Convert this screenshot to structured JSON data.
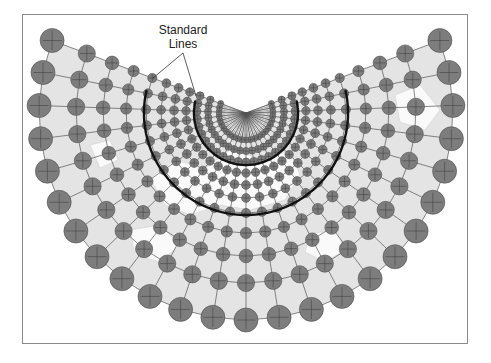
{
  "figure": {
    "label_line1": "Standard",
    "label_line2": "Lines",
    "label_position": {
      "x": 183,
      "y": 23
    },
    "leader_origin": {
      "x": 183,
      "y": 53
    },
    "leader_targets": [
      {
        "x": 153,
        "y": 78
      },
      {
        "x": 196,
        "y": 96
      }
    ]
  },
  "colors": {
    "border": "#8a8a8a",
    "land": "#e4e4e4",
    "ocean": "#ffffff",
    "circle_fill": "#7d7d7d",
    "circle_stroke": "#4a4a4a",
    "grid_line": "#3a3a3a",
    "standard_line": "#111111"
  },
  "chart_data": {
    "type": "diagram",
    "projection": "Equidistant/Conformal conic (two standard parallels)",
    "pole": {
      "x": 246,
      "y": 113
    },
    "angle_start_deg": -20.5,
    "angle_end_deg": 200.5,
    "meridian_count": 25,
    "rings": [
      {
        "r": 27,
        "size": 3.0
      },
      {
        "r": 38,
        "size": 3.6
      },
      {
        "r": 49,
        "size": 4.0
      },
      {
        "r": 60,
        "size": 4.2
      },
      {
        "r": 72,
        "size": 4.4
      },
      {
        "r": 85,
        "size": 4.4
      },
      {
        "r": 100,
        "size": 4.6
      },
      {
        "r": 120,
        "size": 5.6
      },
      {
        "r": 143,
        "size": 6.8
      },
      {
        "r": 170,
        "size": 8.6
      },
      {
        "r": 207,
        "size": 12.0
      }
    ],
    "standard_lines": [
      {
        "r": 52,
        "width": 2.4
      },
      {
        "r": 102,
        "width": 2.4
      }
    ],
    "standard_line_label": "Standard Lines"
  }
}
